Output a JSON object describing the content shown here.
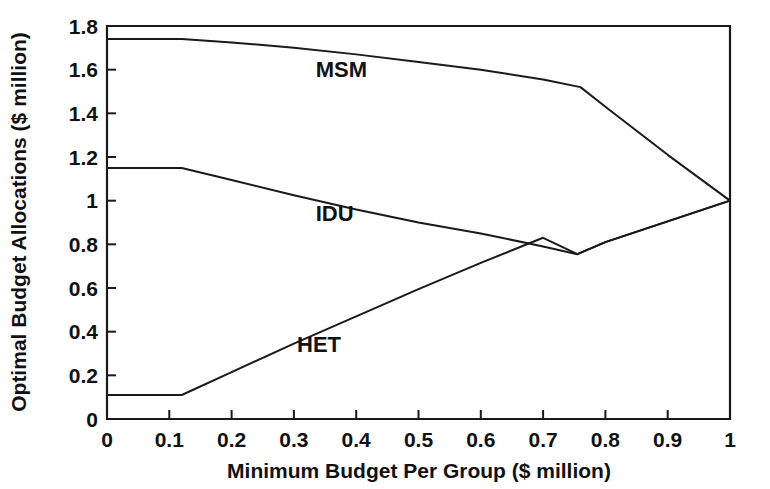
{
  "chart_data": {
    "type": "line",
    "title": "",
    "xlabel": "Minimum Budget Per Group ($ million)",
    "ylabel": "Optimal Budget Allocations ($ million)",
    "xlim": [
      0,
      1.0
    ],
    "ylim": [
      0,
      1.8
    ],
    "grid": false,
    "legend_position": "inline-annotations",
    "xticks": [
      0,
      0.1,
      0.2,
      0.3,
      0.4,
      0.5,
      0.6,
      0.7,
      0.8,
      0.9,
      1
    ],
    "xticklabels": [
      "0",
      "0.1",
      "0.2",
      "0.3",
      "0.4",
      "0.5",
      "0.6",
      "0.7",
      "0.8",
      "0.9",
      "1"
    ],
    "yticks": [
      0,
      0.2,
      0.4,
      0.6,
      0.8,
      1,
      1.2,
      1.4,
      1.6,
      1.8
    ],
    "yticklabels": [
      "0",
      "0.2",
      "0.4",
      "0.6",
      "0.8",
      "1",
      "1.2",
      "1.4",
      "1.6",
      "1.8"
    ],
    "series": [
      {
        "name": "MSM",
        "label_x": 0.335,
        "label_y": 1.565,
        "x": [
          0,
          0.06,
          0.12,
          0.2,
          0.3,
          0.4,
          0.5,
          0.6,
          0.7,
          0.76,
          0.8,
          0.9,
          1.0
        ],
        "y": [
          1.74,
          1.74,
          1.74,
          1.725,
          1.7,
          1.67,
          1.635,
          1.6,
          1.555,
          1.52,
          1.43,
          1.21,
          1.0
        ]
      },
      {
        "name": "IDU",
        "label_x": 0.335,
        "label_y": 0.905,
        "x": [
          0,
          0.06,
          0.12,
          0.2,
          0.3,
          0.4,
          0.5,
          0.6,
          0.7,
          0.755,
          0.8,
          0.9,
          1.0
        ],
        "y": [
          1.15,
          1.15,
          1.15,
          1.095,
          1.025,
          0.96,
          0.9,
          0.85,
          0.79,
          0.755,
          0.81,
          0.905,
          1.0
        ]
      },
      {
        "name": "HET",
        "label_x": 0.305,
        "label_y": 0.305,
        "x": [
          0,
          0.06,
          0.12,
          0.2,
          0.3,
          0.4,
          0.5,
          0.6,
          0.7,
          0.755,
          0.8,
          0.9,
          1.0
        ],
        "y": [
          0.11,
          0.11,
          0.11,
          0.215,
          0.345,
          0.47,
          0.595,
          0.715,
          0.83,
          0.755,
          0.81,
          0.905,
          1.0
        ]
      }
    ]
  }
}
